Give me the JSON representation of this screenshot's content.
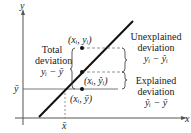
{
  "diagram": {
    "axes": {
      "y_label": "y",
      "x_label": "x"
    },
    "ybar_label": "ȳ",
    "xbar_label": "x̄",
    "points": {
      "observed": "(xᵢ, yᵢ)",
      "predicted": "(xᵢ, ŷᵢ)",
      "mean": "(xᵢ, ȳ)"
    },
    "total": {
      "line1": "Total",
      "line2": "deviation",
      "formula": "yᵢ − ȳ"
    },
    "unexplained": {
      "line1": "Unexplained",
      "line2": "deviation",
      "formula": "yᵢ − ŷᵢ"
    },
    "explained": {
      "line1": "Explained",
      "line2": "deviation",
      "formula": "ŷᵢ − ȳ"
    },
    "colors": {
      "line": "#111111",
      "axis": "#555555",
      "dashed": "#666666"
    }
  }
}
